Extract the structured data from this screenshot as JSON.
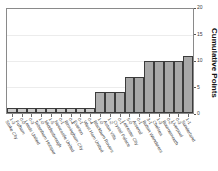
{
  "title_fragment": "",
  "chart_data": {
    "type": "bar",
    "title": "",
    "xlabel": "",
    "ylabel": "Cumulative Points",
    "ylim": [
      0,
      20
    ],
    "yticks": [
      0,
      5,
      10,
      15,
      20
    ],
    "grid": true,
    "legend": false,
    "orientation": "vertical",
    "bar_color": "#b3b3b3",
    "bar_edge_color": "#3c3c3c",
    "categories": [
      "Stoke City",
      "Fulham",
      "Leeds United",
      "Tottenham Hotspur",
      "Middlesbrough",
      "Newcastle United",
      "Birmingham City",
      "Everton",
      "West Ham United",
      "Blackburn Rovers",
      "Aston Villa",
      "Crystal Palace",
      "Leicester City",
      "Arsenal",
      "Bolton Wanderers",
      "Chelsea",
      "Bournemouth",
      "Liverpool",
      "Sunderland"
    ],
    "scores": [
      "1-3",
      "0-0",
      "0-3",
      "1-0",
      "1-5",
      "0-1",
      "0-4",
      "0-1",
      "0-4",
      "1-0",
      "1-2",
      "0-1",
      "5-0",
      "0-1",
      "3-1",
      "1-3",
      "0-2",
      "0-3",
      "1-1"
    ],
    "values": [
      1,
      1,
      1,
      1,
      1,
      1,
      1,
      1,
      1,
      4,
      4,
      4,
      7,
      7,
      10,
      10,
      10,
      10,
      11
    ]
  },
  "y_axis": {
    "label": "Cumulative Points",
    "ticks": [
      "0",
      "5",
      "10",
      "15",
      "20"
    ]
  }
}
